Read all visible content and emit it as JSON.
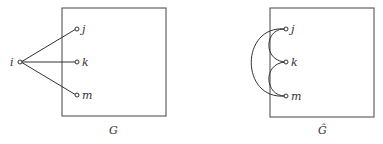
{
  "diagram": {
    "left": {
      "caption": "G",
      "external_node": "i",
      "nodes": [
        "j",
        "k",
        "m"
      ]
    },
    "right": {
      "caption": "Ĝ",
      "nodes": [
        "j",
        "k",
        "m"
      ]
    }
  }
}
